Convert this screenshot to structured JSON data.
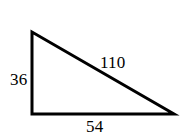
{
  "figure": {
    "type": "right-triangle-diagram",
    "background_color": "#ffffff",
    "stroke_color": "#000000",
    "stroke_width": 3,
    "width": 187,
    "height": 136,
    "vertices": {
      "apex_top_left": [
        32,
        32
      ],
      "right_angle_bottom_left": [
        32,
        114
      ],
      "bottom_right": [
        174,
        114
      ]
    },
    "labels": {
      "vertical_leg": "36",
      "hypotenuse": "110",
      "base": "54"
    }
  }
}
